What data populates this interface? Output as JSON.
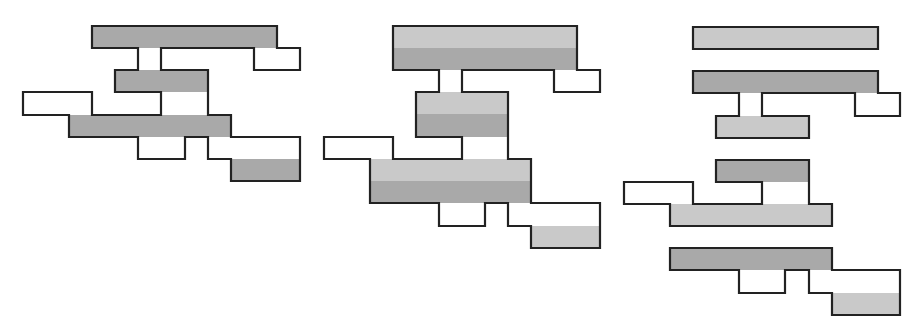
{
  "colors": {
    "background": "#ffffff",
    "stroke": "#222222",
    "dark_fill": "#a9a9a9",
    "light_fill": "#c9c9c9",
    "empty_fill": "#ffffff"
  },
  "stroke_width": 2.2,
  "figures": [
    {
      "name": "figure-left",
      "fills": [
        {
          "x": 92,
          "y": 26,
          "w": 185,
          "h": 22,
          "tone": "dark_fill"
        },
        {
          "x": 115,
          "y": 70,
          "w": 93,
          "h": 22,
          "tone": "dark_fill"
        },
        {
          "x": 69,
          "y": 115,
          "w": 162,
          "h": 22,
          "tone": "dark_fill"
        },
        {
          "x": 231,
          "y": 159,
          "w": 69,
          "h": 22,
          "tone": "dark_fill"
        }
      ],
      "outlines": [
        [
          [
            92,
            26
          ],
          [
            277,
            26
          ],
          [
            277,
            48
          ],
          [
            300,
            48
          ],
          [
            300,
            70
          ],
          [
            254,
            70
          ],
          [
            254,
            48
          ],
          [
            161,
            48
          ],
          [
            161,
            70
          ],
          [
            208,
            70
          ],
          [
            208,
            115
          ],
          [
            231,
            115
          ],
          [
            231,
            137
          ],
          [
            300,
            137
          ],
          [
            300,
            181
          ],
          [
            231,
            181
          ],
          [
            231,
            159
          ],
          [
            208,
            159
          ],
          [
            208,
            137
          ],
          [
            185,
            137
          ],
          [
            185,
            159
          ],
          [
            138,
            159
          ],
          [
            138,
            137
          ],
          [
            69,
            137
          ],
          [
            69,
            115
          ],
          [
            23,
            115
          ],
          [
            23,
            92
          ],
          [
            92,
            92
          ],
          [
            92,
            115
          ],
          [
            161,
            115
          ],
          [
            161,
            92
          ],
          [
            115,
            92
          ],
          [
            115,
            70
          ],
          [
            138,
            70
          ],
          [
            138,
            48
          ],
          [
            92,
            48
          ],
          [
            92,
            26
          ]
        ]
      ]
    },
    {
      "name": "figure-middle",
      "fills": [
        {
          "x": 393,
          "y": 26,
          "w": 184,
          "h": 22,
          "tone": "light_fill"
        },
        {
          "x": 393,
          "y": 48,
          "w": 184,
          "h": 22,
          "tone": "dark_fill"
        },
        {
          "x": 416,
          "y": 92,
          "w": 92,
          "h": 22,
          "tone": "light_fill"
        },
        {
          "x": 416,
          "y": 114,
          "w": 92,
          "h": 23,
          "tone": "dark_fill"
        },
        {
          "x": 370,
          "y": 159,
          "w": 161,
          "h": 22,
          "tone": "light_fill"
        },
        {
          "x": 370,
          "y": 181,
          "w": 161,
          "h": 22,
          "tone": "dark_fill"
        },
        {
          "x": 531,
          "y": 226,
          "w": 69,
          "h": 22,
          "tone": "light_fill"
        }
      ],
      "outlines": [
        [
          [
            393,
            26
          ],
          [
            577,
            26
          ],
          [
            577,
            70
          ],
          [
            600,
            70
          ],
          [
            600,
            92
          ],
          [
            554,
            92
          ],
          [
            554,
            70
          ],
          [
            462,
            70
          ],
          [
            462,
            92
          ],
          [
            508,
            92
          ],
          [
            508,
            159
          ],
          [
            531,
            159
          ],
          [
            531,
            203
          ],
          [
            600,
            203
          ],
          [
            600,
            248
          ],
          [
            531,
            248
          ],
          [
            531,
            226
          ],
          [
            508,
            226
          ],
          [
            508,
            203
          ],
          [
            485,
            203
          ],
          [
            485,
            226
          ],
          [
            439,
            226
          ],
          [
            439,
            203
          ],
          [
            370,
            203
          ],
          [
            370,
            159
          ],
          [
            324,
            159
          ],
          [
            324,
            137
          ],
          [
            393,
            137
          ],
          [
            393,
            159
          ],
          [
            462,
            159
          ],
          [
            462,
            137
          ],
          [
            416,
            137
          ],
          [
            416,
            92
          ],
          [
            439,
            92
          ],
          [
            439,
            70
          ],
          [
            393,
            70
          ],
          [
            393,
            26
          ]
        ]
      ]
    },
    {
      "name": "figure-right",
      "fills": [
        {
          "x": 693,
          "y": 27,
          "w": 185,
          "h": 22,
          "tone": "light_fill"
        },
        {
          "x": 693,
          "y": 71,
          "w": 185,
          "h": 22,
          "tone": "dark_fill"
        },
        {
          "x": 716,
          "y": 116,
          "w": 93,
          "h": 22,
          "tone": "light_fill"
        },
        {
          "x": 716,
          "y": 160,
          "w": 93,
          "h": 22,
          "tone": "dark_fill"
        },
        {
          "x": 670,
          "y": 204,
          "w": 162,
          "h": 22,
          "tone": "light_fill"
        },
        {
          "x": 670,
          "y": 248,
          "w": 162,
          "h": 22,
          "tone": "dark_fill"
        },
        {
          "x": 832,
          "y": 293,
          "w": 68,
          "h": 22,
          "tone": "light_fill"
        }
      ],
      "outlines": [
        [
          [
            693,
            27
          ],
          [
            878,
            27
          ],
          [
            878,
            49
          ],
          [
            693,
            49
          ],
          [
            693,
            27
          ]
        ],
        [
          [
            693,
            71
          ],
          [
            878,
            71
          ],
          [
            878,
            93
          ],
          [
            900,
            93
          ],
          [
            900,
            116
          ],
          [
            855,
            116
          ],
          [
            855,
            93
          ],
          [
            762,
            93
          ],
          [
            762,
            116
          ],
          [
            809,
            116
          ],
          [
            809,
            138
          ],
          [
            716,
            138
          ],
          [
            716,
            116
          ],
          [
            739,
            116
          ],
          [
            739,
            93
          ],
          [
            693,
            93
          ],
          [
            693,
            71
          ]
        ],
        [
          [
            716,
            160
          ],
          [
            809,
            160
          ],
          [
            809,
            204
          ],
          [
            832,
            204
          ],
          [
            832,
            226
          ],
          [
            670,
            226
          ],
          [
            670,
            204
          ],
          [
            624,
            204
          ],
          [
            624,
            182
          ],
          [
            693,
            182
          ],
          [
            693,
            204
          ],
          [
            762,
            204
          ],
          [
            762,
            182
          ],
          [
            716,
            182
          ],
          [
            716,
            160
          ]
        ],
        [
          [
            670,
            248
          ],
          [
            832,
            248
          ],
          [
            832,
            270
          ],
          [
            900,
            270
          ],
          [
            900,
            315
          ],
          [
            832,
            315
          ],
          [
            832,
            293
          ],
          [
            809,
            293
          ],
          [
            809,
            270
          ],
          [
            785,
            270
          ],
          [
            785,
            293
          ],
          [
            739,
            293
          ],
          [
            739,
            270
          ],
          [
            670,
            270
          ],
          [
            670,
            248
          ]
        ]
      ]
    }
  ]
}
